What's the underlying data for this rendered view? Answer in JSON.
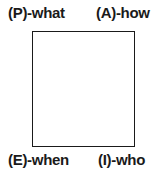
{
  "diagram": {
    "labels": {
      "top_left": "(P)-what",
      "top_right": "(A)-how",
      "bottom_left": "(E)-when",
      "bottom_right": "(I)-who"
    }
  }
}
